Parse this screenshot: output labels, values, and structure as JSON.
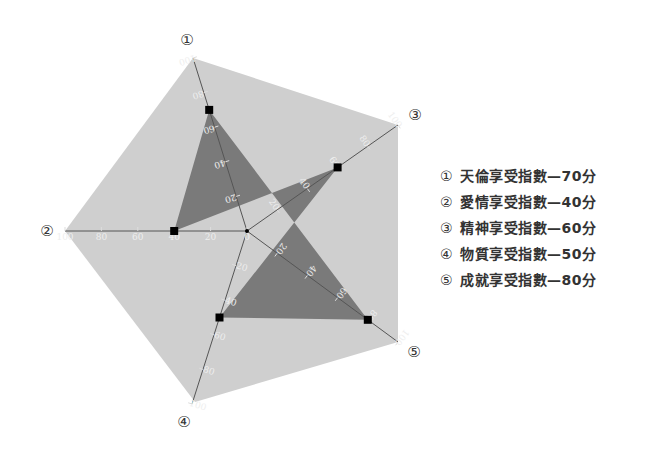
{
  "chart_data": {
    "type": "radar",
    "title": "",
    "axes": [
      {
        "marker": "①",
        "name": "天倫享受指數",
        "value": 70
      },
      {
        "marker": "②",
        "name": "愛情享受指數",
        "value": 40
      },
      {
        "marker": "③",
        "name": "精神享受指數",
        "value": 60
      },
      {
        "marker": "④",
        "name": "物質享受指數",
        "value": 50
      },
      {
        "marker": "⑤",
        "name": "成就享受指數",
        "value": 80
      }
    ],
    "range": [
      0,
      100
    ],
    "ticks": [
      0,
      20,
      40,
      60,
      80,
      100
    ],
    "unit": "分",
    "legend_position": "right",
    "colors": {
      "outer_fill": "#cfcfcf",
      "data_fill": "#7a7a7a",
      "axis_line": "#555555",
      "tick_label": "#eeeeee",
      "marker": "#000000"
    }
  },
  "legend": [
    {
      "marker": "①",
      "text": "天倫享受指數—70分"
    },
    {
      "marker": "②",
      "text": "愛情享受指數—40分"
    },
    {
      "marker": "③",
      "text": "精神享受指數—60分"
    },
    {
      "marker": "④",
      "text": "物質享受指數—50分"
    },
    {
      "marker": "⑤",
      "text": "成就享受指數—80分"
    }
  ]
}
